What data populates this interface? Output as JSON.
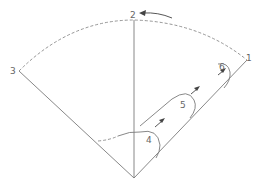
{
  "diagram": {
    "type": "sector-rotation-diagram",
    "labels": {
      "p1": "1",
      "p2": "2",
      "p3": "3",
      "p4": "4",
      "p5": "5",
      "p6": "6"
    },
    "colors": {
      "line": "#7a7a7a",
      "dashed": "#8a8a8a",
      "arrow": "#444444",
      "background": "#ffffff"
    }
  }
}
